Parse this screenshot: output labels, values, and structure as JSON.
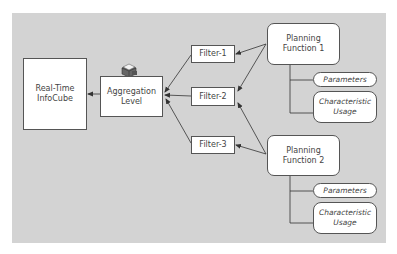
{
  "diagram": {
    "nodes": {
      "infocube": {
        "label": "Real-Time\nInfoCube"
      },
      "aggregation_level": {
        "label": "Aggregation\nLevel",
        "icon": "database-cube-icon"
      },
      "filter1": {
        "label": "Filter-1"
      },
      "filter2": {
        "label": "Filter-2"
      },
      "filter3": {
        "label": "Filter-3"
      },
      "pf1": {
        "label": "Planning\nFunction 1",
        "parameters": "Parameters",
        "char_usage": "Characteristic\nUsage"
      },
      "pf2": {
        "label": "Planning\nFunction 2",
        "parameters": "Parameters",
        "char_usage": "Characteristic\nUsage"
      }
    },
    "edges": [
      {
        "from": "aggregation_level",
        "to": "infocube"
      },
      {
        "from": "filter1",
        "to": "aggregation_level"
      },
      {
        "from": "filter2",
        "to": "aggregation_level"
      },
      {
        "from": "filter3",
        "to": "aggregation_level"
      },
      {
        "from": "pf1",
        "to": "filter1"
      },
      {
        "from": "pf1",
        "to": "filter2"
      },
      {
        "from": "pf2",
        "to": "filter2"
      },
      {
        "from": "pf2",
        "to": "filter3"
      },
      {
        "from": "pf1",
        "to": "pf1.parameters",
        "type": "tree"
      },
      {
        "from": "pf1",
        "to": "pf1.char_usage",
        "type": "tree"
      },
      {
        "from": "pf2",
        "to": "pf2.parameters",
        "type": "tree"
      },
      {
        "from": "pf2",
        "to": "pf2.char_usage",
        "type": "tree"
      }
    ],
    "colors": {
      "background": "#d3d3d3",
      "box": "#ffffff",
      "line": "#333333",
      "text": "#444444"
    }
  }
}
